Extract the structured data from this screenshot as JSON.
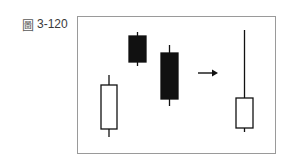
{
  "figure": {
    "label_glyph": "圖",
    "label_number": "3-120"
  },
  "chart_data": {
    "type": "candlestick-diagram",
    "title": "圖 3-120",
    "left_group": [
      {
        "color": "white",
        "body_top": 85,
        "body_bottom": 129,
        "wick_top": 75,
        "wick_bottom": 137,
        "x_left": 101,
        "x_right": 117
      },
      {
        "color": "black",
        "body_top": 36,
        "body_bottom": 62,
        "wick_top": 32,
        "wick_bottom": 66,
        "x_left": 129,
        "x_right": 146
      },
      {
        "color": "black",
        "body_top": 53,
        "body_bottom": 99,
        "wick_top": 45,
        "wick_bottom": 106,
        "x_left": 161,
        "x_right": 178
      }
    ],
    "arrow": {
      "x1": 198,
      "x2": 218,
      "y": 73,
      "direction": "right"
    },
    "right_group": [
      {
        "color": "white",
        "body_top": 98,
        "body_bottom": 128,
        "wick_top": 30,
        "wick_bottom": 132,
        "x_left": 236,
        "x_right": 253
      }
    ],
    "colors": {
      "frame": "#9a9a9a",
      "ink": "#111111",
      "fill_white": "#ffffff"
    }
  }
}
